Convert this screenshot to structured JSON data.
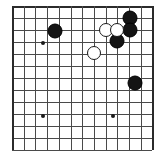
{
  "figure": {
    "board_type": "go-goban-partial"
  },
  "board": {
    "origin_x": 12,
    "origin_y": 6,
    "col_spacing": 11.7,
    "row_spacing": 12.0,
    "columns": 13,
    "rows": 13,
    "line_color": "#4a4a4a",
    "edge_color": "#2b2b2b",
    "background_color": "#ffffff",
    "top_edge": true,
    "left_edge": true,
    "right_edge": true,
    "bottom_edge": false
  },
  "star_points": [
    {
      "name": "star-point-upper-left",
      "col": 2.65,
      "row": 3.1
    },
    {
      "name": "star-point-lower-left",
      "col": 2.65,
      "row": 9.2
    },
    {
      "name": "star-point-lower-right",
      "col": 8.65,
      "row": 9.2
    }
  ],
  "stones": [
    {
      "name": "black-stone-upper-left",
      "color": "black",
      "col": 3.7,
      "row": 2.1,
      "radius": 7.5
    },
    {
      "name": "black-stone-top-right-upper",
      "color": "black",
      "col": 10.1,
      "row": 1.0,
      "radius": 7.5
    },
    {
      "name": "black-stone-top-right-lower",
      "color": "black",
      "col": 10.1,
      "row": 2.0,
      "radius": 7.5
    },
    {
      "name": "black-stone-center-right",
      "color": "black",
      "col": 9.0,
      "row": 2.9,
      "radius": 7.5
    },
    {
      "name": "black-stone-right-middle",
      "color": "black",
      "col": 10.5,
      "row": 6.4,
      "radius": 7.5
    },
    {
      "name": "white-stone-left",
      "color": "white",
      "col": 8.0,
      "row": 2.0,
      "radius": 7.0
    },
    {
      "name": "white-stone-right",
      "color": "white",
      "col": 9.0,
      "row": 2.0,
      "radius": 7.0
    },
    {
      "name": "white-stone-lower",
      "color": "white",
      "col": 7.0,
      "row": 3.9,
      "radius": 7.0
    }
  ]
}
